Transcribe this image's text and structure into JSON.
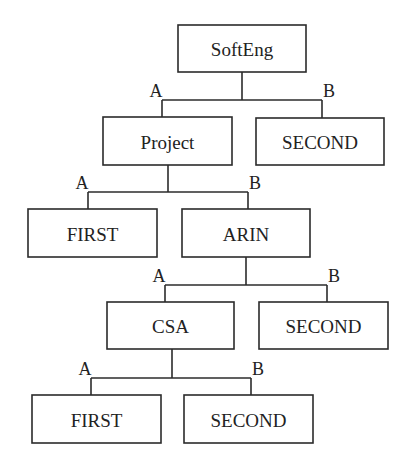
{
  "diagram": {
    "type": "decision-tree",
    "line_color": "#2b2b2b",
    "nodes": [
      {
        "id": "softeng",
        "label": "SoftEng",
        "x": 178,
        "y": 25,
        "w": 128,
        "h": 47
      },
      {
        "id": "project",
        "label": "Project",
        "x": 103,
        "y": 117,
        "w": 129,
        "h": 48
      },
      {
        "id": "second1",
        "label": "SECOND",
        "x": 256,
        "y": 118,
        "w": 128,
        "h": 47
      },
      {
        "id": "first1",
        "label": "FIRST",
        "x": 28,
        "y": 209,
        "w": 129,
        "h": 48
      },
      {
        "id": "arin",
        "label": "ARIN",
        "x": 182,
        "y": 209,
        "w": 128,
        "h": 48
      },
      {
        "id": "csa",
        "label": "CSA",
        "x": 107,
        "y": 302,
        "w": 127,
        "h": 47
      },
      {
        "id": "second2",
        "label": "SECOND",
        "x": 259,
        "y": 302,
        "w": 129,
        "h": 47
      },
      {
        "id": "first2",
        "label": "FIRST",
        "x": 32,
        "y": 395,
        "w": 129,
        "h": 48
      },
      {
        "id": "second3",
        "label": "SECOND",
        "x": 184,
        "y": 395,
        "w": 129,
        "h": 48
      }
    ],
    "splits": [
      {
        "parent": "softeng",
        "stem_x": 242,
        "bar_y": 100,
        "a_x": 162,
        "b_x": 322,
        "a_child": "project",
        "b_child": "second1",
        "a_label": "A",
        "b_label": "B"
      },
      {
        "parent": "project",
        "stem_x": 168,
        "bar_y": 192,
        "a_x": 88,
        "b_x": 248,
        "a_child": "first1",
        "b_child": "arin",
        "a_label": "A",
        "b_label": "B"
      },
      {
        "parent": "arin",
        "stem_x": 246,
        "bar_y": 285,
        "a_x": 165,
        "b_x": 327,
        "a_child": "csa",
        "b_child": "second2",
        "a_label": "A",
        "b_label": "B"
      },
      {
        "parent": "csa",
        "stem_x": 172,
        "bar_y": 378,
        "a_x": 91,
        "b_x": 251,
        "a_child": "first2",
        "b_child": "second3",
        "a_label": "A",
        "b_label": "B"
      }
    ]
  }
}
